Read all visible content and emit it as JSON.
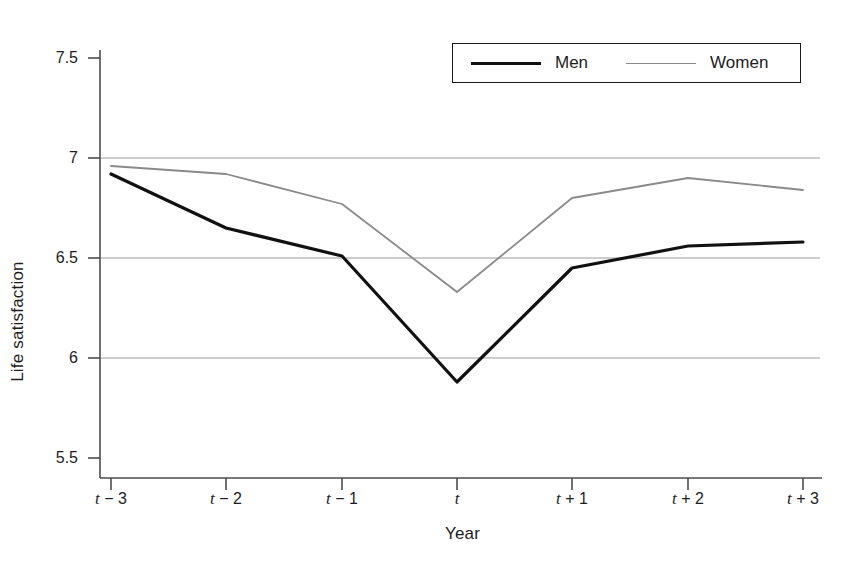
{
  "chart_data": {
    "type": "line",
    "title": "",
    "xlabel": "Year",
    "ylabel": "Life satisfaction",
    "categories": [
      "t − 3",
      "t − 2",
      "t − 1",
      "t",
      "t + 1",
      "t + 2",
      "t + 3"
    ],
    "x_tick_labels": [
      {
        "base": "t",
        "suffix": " − 3"
      },
      {
        "base": "t",
        "suffix": " − 2"
      },
      {
        "base": "t",
        "suffix": " − 1"
      },
      {
        "base": "t",
        "suffix": ""
      },
      {
        "base": "t",
        "suffix": " + 1"
      },
      {
        "base": "t",
        "suffix": " + 2"
      },
      {
        "base": "t",
        "suffix": " + 3"
      }
    ],
    "y_tick_labels": [
      "7.5",
      "7",
      "6.5",
      "6",
      "5.5"
    ],
    "y_tick_values": [
      7.5,
      7,
      6.5,
      6,
      5.5
    ],
    "ylim": [
      5.5,
      7.5
    ],
    "xlim": [
      0,
      6
    ],
    "grid": "horizontal gridlines at 6, 6.5 and 7",
    "gridline_values": [
      7,
      6.5,
      6
    ],
    "legend_position": "top-right",
    "series": [
      {
        "name": "Men",
        "color": "#111111",
        "line_width": 3.2,
        "values": [
          6.92,
          6.65,
          6.51,
          5.88,
          6.45,
          6.56,
          6.58
        ]
      },
      {
        "name": "Women",
        "color": "#8a8a8a",
        "line_width": 1.8,
        "values": [
          6.96,
          6.92,
          6.77,
          6.33,
          6.8,
          6.9,
          6.84
        ]
      }
    ]
  },
  "legend": {
    "items": [
      {
        "label": "Men",
        "swatch": "thick-black-line"
      },
      {
        "label": "Women",
        "swatch": "thin-gray-line"
      }
    ]
  },
  "colors": {
    "men": "#111111",
    "women": "#8a8a8a",
    "axis": "#4d4d4d",
    "grid": "#9a9a9a",
    "background": "#ffffff"
  }
}
